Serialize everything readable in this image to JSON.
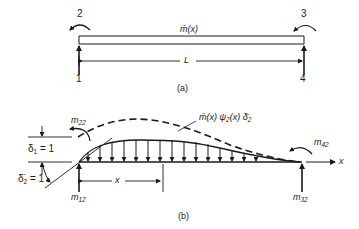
{
  "figure_a": {
    "caption": "(a)",
    "mass_label": "m̄(x)",
    "length_label": "L",
    "dof_labels": [
      "1",
      "2",
      "3",
      "4"
    ]
  },
  "figure_b": {
    "caption": "(b)",
    "inertia_label": "m̄(x) ψ̈₂(x) δ̈₂",
    "inertia_label_parts": {
      "m": "m̄(x) ψ",
      "sub": "2",
      "mid": "(x) δ̈",
      "sub2": "2"
    },
    "delta1": {
      "sym": "δ",
      "sub": "1",
      "eq": "= 1"
    },
    "delta2": {
      "sym": "δ̈",
      "sub": "2",
      "eq": "= 1"
    },
    "x_label": "x",
    "x_axis_label": "x",
    "moments": {
      "m22": {
        "base": "m",
        "sub": "22"
      },
      "m12": {
        "base": "m",
        "sub": "12"
      },
      "m42": {
        "base": "m",
        "sub": "42"
      },
      "m32": {
        "base": "m",
        "sub": "32"
      }
    }
  },
  "colors": {
    "ink": "#1a1a1a",
    "background": "#ffffff"
  }
}
